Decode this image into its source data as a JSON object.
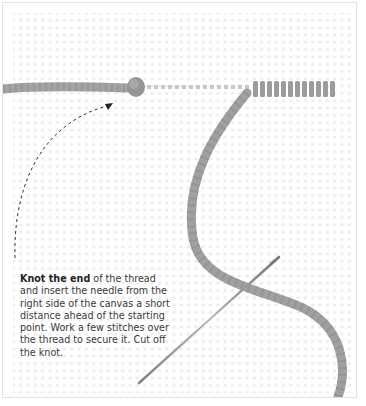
{
  "figure": {
    "elements": [
      "canvas-grid",
      "thread",
      "knot",
      "dashed-arrow",
      "needle",
      "worked-stitches"
    ]
  },
  "caption": {
    "bold": "Knot the end",
    "text": " of the thread and insert the needle from the right side of the canvas a short distance ahead of the starting point. Work a few stitches over the thread to secure it. Cut off the knot."
  },
  "colors": {
    "thread": "#9a9a9a",
    "canvas_dot": "#dcdcdc",
    "border": "#e2e2e2",
    "text": "#3a3a3a"
  }
}
